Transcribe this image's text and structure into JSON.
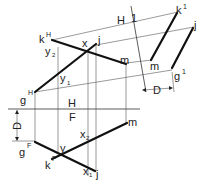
{
  "diagram": {
    "title": "",
    "colors": {
      "line": "#111111",
      "construction": "#555555",
      "text": "#222222",
      "background": "#ffffff"
    },
    "fold_lines": {
      "hf": {
        "upper": "H",
        "lower": "F"
      },
      "h1": {
        "left": "H",
        "right": "1"
      }
    },
    "labels": {
      "kH": {
        "base": "k",
        "sup": "H"
      },
      "y2": {
        "base": "y",
        "sub": "2"
      },
      "x_top": {
        "base": "x"
      },
      "j_top": {
        "base": "j"
      },
      "y1": {
        "base": "y",
        "sub": "1"
      },
      "m_top": {
        "base": "m"
      },
      "gH": {
        "base": "g",
        "sup": "H"
      },
      "k1": {
        "base": "k",
        "sup": "1"
      },
      "j1": {
        "base": "j"
      },
      "m1": {
        "base": "m"
      },
      "g1": {
        "base": "g",
        "sup": "1"
      },
      "D_aux": "D",
      "D_front": "D",
      "gF": {
        "base": "g",
        "sup": "F"
      },
      "y_front": {
        "base": "y"
      },
      "x2": {
        "base": "x",
        "sub": "2"
      },
      "m_front": {
        "base": "m"
      },
      "kF": {
        "base": "k",
        "sup": "F"
      },
      "x1": {
        "base": "x",
        "sub": "1"
      },
      "j_front": {
        "base": "j"
      }
    }
  }
}
